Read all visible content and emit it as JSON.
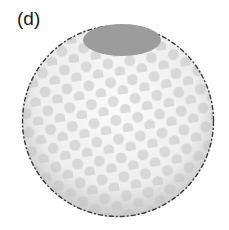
{
  "figure": {
    "panel_label": "(d)",
    "colors": {
      "background": "#ffffff",
      "sphere_fill": "#f4f4f4",
      "sphere_shade": "#c8c8c8",
      "dimple": "#c4c4c4",
      "cap": "#9c9c9c",
      "outline": "#3a3a3a"
    }
  }
}
